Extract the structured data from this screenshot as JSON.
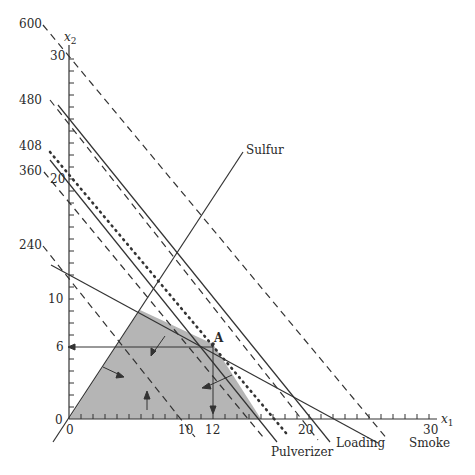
{
  "diagram": {
    "type": "linear-programming-feasible-region",
    "axes": {
      "x_label": "x",
      "x_sub": "1",
      "y_label": "x",
      "y_sub": "2",
      "x_ticks": [
        {
          "value": 0,
          "label": "0"
        },
        {
          "value": 10,
          "label": "10"
        },
        {
          "value": 12,
          "label": "12"
        },
        {
          "value": 20,
          "label": "20"
        },
        {
          "value": 30,
          "label": "30"
        }
      ],
      "y_ticks": [
        {
          "value": 0,
          "label": "0"
        },
        {
          "value": 6,
          "label": "6"
        },
        {
          "value": 10,
          "label": "10"
        },
        {
          "value": 20,
          "label": "20"
        },
        {
          "value": 30,
          "label": "30"
        }
      ],
      "x_range": [
        0,
        30
      ],
      "y_range": [
        0,
        30
      ]
    },
    "objective_levels": [
      "600",
      "480",
      "408",
      "360",
      "240"
    ],
    "constraints": [
      "Sulfur",
      "Pulverizer",
      "Loading",
      "Smoke"
    ],
    "point_label": "A",
    "optimal_point": {
      "x1": 12,
      "x2": 6
    },
    "feasible_region_color": "#b5b5b5"
  }
}
